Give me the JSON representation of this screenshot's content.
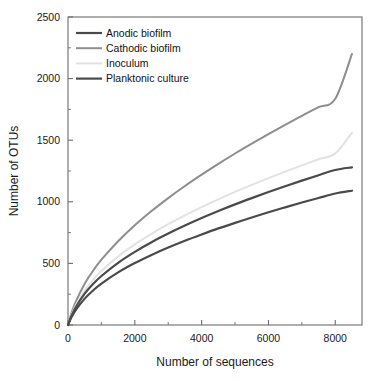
{
  "chart_data": {
    "type": "line",
    "title": "",
    "subtitle": "",
    "xlabel": "Number of sequences",
    "ylabel": "Number of OTUs",
    "xlim": [
      0,
      8800
    ],
    "ylim": [
      0,
      2500
    ],
    "grid": false,
    "legend_position": "top-left",
    "x_ticks": [
      0,
      2000,
      4000,
      6000,
      8000
    ],
    "x_tick_labels": [
      "0",
      "2000",
      "4000",
      "6000",
      "8000"
    ],
    "x_minor_ticks": [
      1000,
      3000,
      5000,
      7000
    ],
    "y_ticks": [
      0,
      500,
      1000,
      1500,
      2000,
      2500
    ],
    "y_tick_labels": [
      "0",
      "500",
      "1000",
      "1500",
      "2000",
      "2500"
    ],
    "y_minor_ticks": [
      250,
      750,
      1250,
      1750,
      2250
    ],
    "x": [
      0,
      100,
      250,
      500,
      750,
      1000,
      1500,
      2000,
      2500,
      3000,
      3500,
      4000,
      4500,
      5000,
      5500,
      6000,
      6500,
      7000,
      7500,
      8000,
      8500
    ],
    "series": [
      {
        "name": "Cathodic biofilm",
        "color": "#8e8e8e",
        "width": 2.0,
        "values": [
          0,
          95,
          200,
          335,
          440,
          530,
          680,
          810,
          925,
          1030,
          1128,
          1220,
          1308,
          1392,
          1472,
          1550,
          1625,
          1698,
          1768,
          1836,
          2200
        ]
      },
      {
        "name": "Inoculum",
        "color": "#e2e2e2",
        "width": 2.0,
        "values": [
          0,
          80,
          168,
          280,
          366,
          438,
          556,
          654,
          740,
          818,
          890,
          957,
          1020,
          1080,
          1137,
          1192,
          1245,
          1296,
          1345,
          1393,
          1560
        ]
      },
      {
        "name": "Anodic biofilm",
        "color": "#4a4a4a",
        "width": 2.2,
        "values": [
          0,
          72,
          152,
          254,
          332,
          398,
          505,
          594,
          672,
          742,
          807,
          868,
          925,
          979,
          1030,
          1079,
          1126,
          1172,
          1216,
          1258,
          1280
        ]
      },
      {
        "name": "Planktonic culture",
        "color": "#4a4a4a",
        "width": 2.2,
        "values": [
          0,
          60,
          128,
          214,
          280,
          336,
          427,
          503,
          569,
          629,
          684,
          735,
          784,
          829,
          873,
          915,
          955,
          994,
          1031,
          1067,
          1090
        ]
      }
    ],
    "annotations": []
  },
  "legend": {
    "entries": [
      {
        "label": "Anodic biofilm",
        "color": "#4a4a4a",
        "width": 2.2
      },
      {
        "label": "Cathodic biofilm",
        "color": "#8e8e8e",
        "width": 2.0
      },
      {
        "label": "Inoculum",
        "color": "#e2e2e2",
        "width": 2.0
      },
      {
        "label": "Planktonic culture",
        "color": "#4a4a4a",
        "width": 2.2
      }
    ]
  },
  "axes": {
    "frame_color": "#6d6d6d",
    "text_color": "#1a1a1a"
  }
}
